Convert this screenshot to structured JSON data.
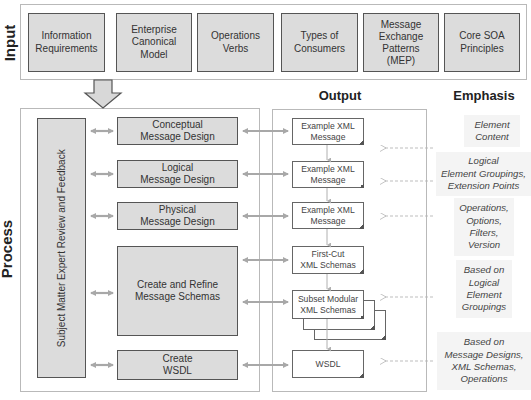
{
  "sections": {
    "input_label": "Input",
    "process_label": "Process",
    "output_heading": "Output",
    "emphasis_heading": "Emphasis"
  },
  "inputs": [
    {
      "label": "Information\nRequirements"
    },
    {
      "label": "Enterprise\nCanonical\nModel"
    },
    {
      "label": "Operations\nVerbs"
    },
    {
      "label": "Types of\nConsumers"
    },
    {
      "label": "Message\nExchange\nPatterns\n(MEP)"
    },
    {
      "label": "Core SOA\nPrinciples"
    }
  ],
  "process": {
    "review_box": "Subject Matter Expert Review and Feedback",
    "steps": [
      {
        "label": "Conceptual\nMessage Design"
      },
      {
        "label": "Logical\nMessage Design"
      },
      {
        "label": "Physical\nMessage Design"
      },
      {
        "label": "Create  and Refine\nMessage Schemas"
      },
      {
        "label": "Create\nWSDL"
      }
    ]
  },
  "outputs": [
    {
      "label": "Example XML\nMessage"
    },
    {
      "label": "Example XML\nMessage"
    },
    {
      "label": "Example XML\nMessage"
    },
    {
      "label": "First-Cut\nXML Schemas"
    },
    {
      "label": "Subset Modular\nXML Schemas"
    },
    {
      "label": "WSDL"
    }
  ],
  "emphasis": [
    {
      "label": "Element\nContent"
    },
    {
      "label": "Logical\nElement Groupings,\nExtension Points"
    },
    {
      "label": "Operations,\nOptions,\nFilters,\nVersion"
    },
    {
      "label": "Based on\nLogical\nElement\nGroupings"
    },
    {
      "label": "Based on\nMessage Designs,\nXML Schemas,\nOperations"
    }
  ],
  "colors": {
    "box_fill": "#dcdcdc",
    "box_border": "#555555",
    "arrow": "#a8a8a8",
    "frame": "#b9b9b9",
    "emphasis_bg": "#f4f4f4"
  }
}
